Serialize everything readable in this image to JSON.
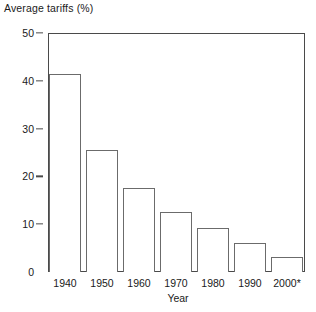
{
  "chart_data": {
    "type": "bar",
    "title": "Average tariffs (%)",
    "xlabel": "Year",
    "ylabel": "Average tariffs (%)",
    "categories": [
      "1940",
      "1950",
      "1960",
      "1970",
      "1980",
      "1990",
      "2000*"
    ],
    "values": [
      41.4,
      25.5,
      17.6,
      12.5,
      9.2,
      6.1,
      3.1
    ],
    "ylim": [
      0,
      50
    ],
    "yticks": [
      0,
      10,
      20,
      30,
      40,
      50
    ],
    "ytick_labels": [
      "0",
      "10",
      "20",
      "30",
      "40",
      "50"
    ],
    "grid": false,
    "legend": null,
    "bar_fill": "#ffffff",
    "bar_edge": "#6b6b6b",
    "axis_color": "#4a4a4a",
    "annotations": [
      "* denotes projected or estimated value for 2000"
    ]
  }
}
